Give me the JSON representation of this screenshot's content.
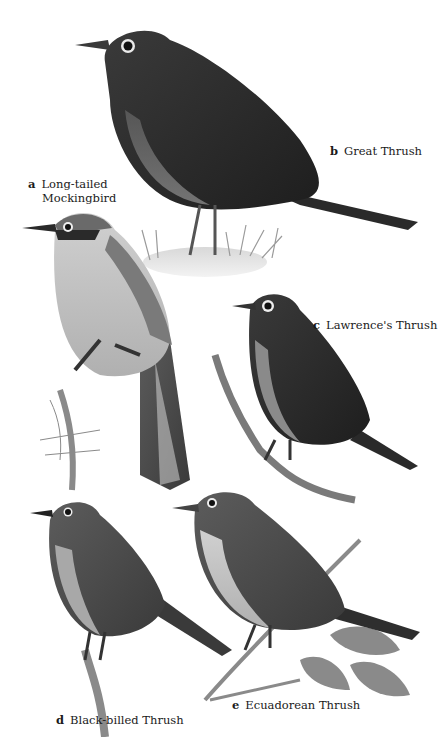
{
  "plate": {
    "title": "Thrushes and Mockingbird plate",
    "colors": {
      "background": "#ffffff",
      "ink": "#1a1a1a",
      "dark_plumage": "#2e2e2e",
      "mid_plumage": "#6a6a6a",
      "light_plumage": "#bdbdbd",
      "branch": "#7a7a7a"
    },
    "species": [
      {
        "letter": "a",
        "name_line1": "Long-tailed",
        "name_line2": "Mockingbird"
      },
      {
        "letter": "b",
        "name": "Great Thrush"
      },
      {
        "letter": "c",
        "name": "Lawrence's Thrush"
      },
      {
        "letter": "d",
        "name": "Black-billed Thrush"
      },
      {
        "letter": "e",
        "name": "Ecuadorean Thrush"
      }
    ]
  }
}
